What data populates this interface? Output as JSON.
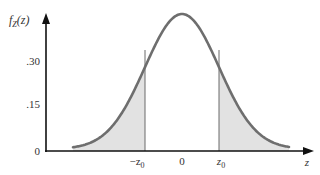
{
  "chart_data": {
    "type": "area",
    "title": "",
    "ylabel": "f_Z(z)",
    "ylabel_display": {
      "main": "f",
      "sub": "Z",
      "rest": "(z)"
    },
    "xlabel": "z",
    "y_ticks": [
      {
        "value": 0,
        "label": "0"
      },
      {
        "value": 0.15,
        "label": ".15"
      },
      {
        "value": 0.3,
        "label": ".30"
      }
    ],
    "x_ticks": [
      {
        "position": "-z0",
        "label_main": "−z",
        "label_sub": "0"
      },
      {
        "position": "0",
        "label_main": "0",
        "label_sub": ""
      },
      {
        "position": "z0",
        "label_main": "z",
        "label_sub": "0"
      }
    ],
    "curve": "standard normal density (bell curve), peak ≈ 0.40 at z = 0",
    "peak_value": 0.4,
    "cut_value_at_z0": 0.31,
    "shaded_regions": [
      "z < -z0",
      "z > z0"
    ],
    "grid": false,
    "legend": null
  },
  "colors": {
    "axis": "#111111",
    "curve": "#6e6e6e",
    "shade": "#e2e2e2",
    "cutline": "#6a6a6a",
    "text": "#333333"
  }
}
